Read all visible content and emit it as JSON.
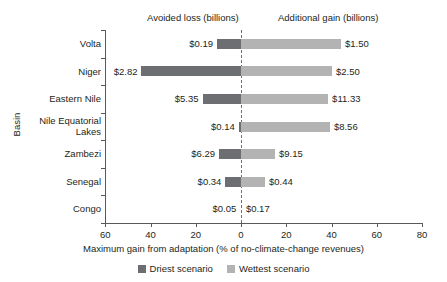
{
  "headers": {
    "left": "Avoided loss (billions)",
    "right": "Additional gain (billions)"
  },
  "axes": {
    "y_title": "Basin",
    "x_title": "Maximum gain from adaptation (% of no-climate-change revenues)",
    "x_ticks": [
      {
        "label": "60",
        "value": -60
      },
      {
        "label": "40",
        "value": -40
      },
      {
        "label": "20",
        "value": -20
      },
      {
        "label": "0",
        "value": 0
      },
      {
        "label": "20",
        "value": 20
      },
      {
        "label": "40",
        "value": 40
      },
      {
        "label": "60",
        "value": 60
      },
      {
        "label": "80",
        "value": 80
      }
    ]
  },
  "legend": {
    "items": [
      {
        "label": "Driest scenario",
        "color": "#6d6e71"
      },
      {
        "label": "Wettest scenario",
        "color": "#b3b3b3"
      }
    ]
  },
  "colors": {
    "driest": "#6d6e71",
    "wettest": "#b3b3b3",
    "axis": "#58595b",
    "text": "#231f20"
  },
  "chart_data": {
    "type": "bar",
    "orientation": "horizontal",
    "title": "",
    "xlabel": "Maximum gain from adaptation (% of no-climate-change revenues)",
    "ylabel": "Basin",
    "xlim": [
      -60,
      80
    ],
    "grid": false,
    "legend_position": "bottom",
    "zero_reference_line": true,
    "categories": [
      "Volta",
      "Niger",
      "Eastern Nile",
      "Nile Equatorial\nLakes",
      "Zambezi",
      "Senegal",
      "Congo"
    ],
    "series": [
      {
        "name": "Driest scenario",
        "color": "#6d6e71",
        "side": "left",
        "values": [
          -10.6,
          -44.0,
          -17.0,
          -1.0,
          -9.7,
          -6.9,
          -0.3
        ],
        "labels": [
          "$0.19",
          "$2.82",
          "$5.35",
          "$0.14",
          "$6.29",
          "$0.34",
          "$0.05"
        ]
      },
      {
        "name": "Wettest scenario",
        "color": "#b3b3b3",
        "side": "right",
        "values": [
          44.2,
          40.2,
          38.5,
          39.3,
          15.0,
          10.6,
          0.4
        ],
        "labels": [
          "$1.50",
          "$2.50",
          "$11.33",
          "$8.56",
          "$9.15",
          "$0.44",
          "$0.17"
        ]
      }
    ]
  }
}
